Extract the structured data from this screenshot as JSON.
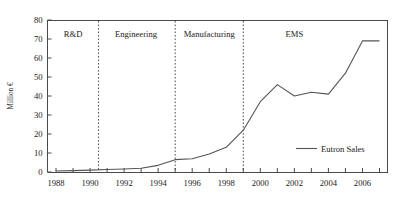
{
  "chart_data": {
    "type": "line",
    "title": "",
    "xlabel": "",
    "ylabel": "Million €",
    "xlim": [
      1987.5,
      2007.5
    ],
    "ylim": [
      0,
      80
    ],
    "grid": false,
    "legend_position": "bottom-right",
    "y_ticks": [
      0,
      10,
      20,
      30,
      40,
      50,
      60,
      70,
      80
    ],
    "y_tick_labels": [
      "0",
      "10",
      "20",
      "30",
      "40",
      "50",
      "60",
      "70",
      "80"
    ],
    "x_ticks": [
      1988,
      1989,
      1990,
      1991,
      1992,
      1993,
      1994,
      1995,
      1996,
      1997,
      1998,
      1999,
      2000,
      2001,
      2002,
      2003,
      2004,
      2005,
      2006,
      2007
    ],
    "x_tick_labels": [
      "1988",
      "",
      "1990",
      "",
      "1992",
      "",
      "1994",
      "",
      "1996",
      "",
      "1998",
      "",
      "2000",
      "",
      "2002",
      "",
      "2004",
      "",
      "2006",
      ""
    ],
    "series": [
      {
        "name": "Eutron Sales",
        "color": "#555555",
        "x": [
          1988,
          1989,
          1990,
          1991,
          1992,
          1993,
          1994,
          1995,
          1996,
          1997,
          1998,
          1999,
          2000,
          2001,
          2002,
          2003,
          2004,
          2005,
          2006,
          2007
        ],
        "values": [
          0.5,
          0.7,
          1.0,
          1.3,
          1.6,
          2.0,
          3.5,
          6.5,
          7.0,
          9.5,
          13.0,
          22.0,
          37.0,
          46.0,
          40.0,
          42.0,
          41.0,
          52.0,
          69.0,
          69.0
        ]
      }
    ],
    "annotations": {
      "phases": [
        {
          "label": "R&D",
          "start": 1987.5,
          "end": 1990.5,
          "center": 1989.0
        },
        {
          "label": "Engineering",
          "start": 1990.5,
          "end": 1995.0,
          "center": 1992.7
        },
        {
          "label": "Manufacturing",
          "start": 1995.0,
          "end": 1999.0,
          "center": 1997.0
        },
        {
          "label": "EMS",
          "start": 1999.0,
          "end": 2007.5,
          "center": 2002.0
        }
      ],
      "dividers": [
        1990.5,
        1995.0,
        1999.0
      ]
    },
    "legend": [
      {
        "label": "Eutron Sales",
        "color": "#555555"
      }
    ]
  }
}
